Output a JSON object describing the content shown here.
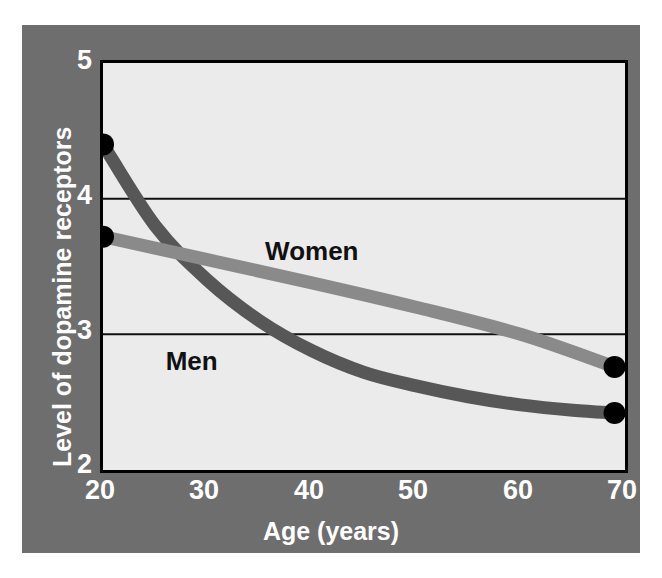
{
  "chart_data": {
    "type": "line",
    "title": "",
    "subtitle": "",
    "xlabel": "Age (years)",
    "ylabel": "Level of dopamine receptors",
    "xlim": [
      20,
      70
    ],
    "ylim": [
      2,
      5
    ],
    "xticks": [
      20,
      30,
      40,
      50,
      60,
      70
    ],
    "yticks": [
      2,
      3,
      4,
      5
    ],
    "xtick_labels": [
      "20",
      "30",
      "40",
      "50",
      "60",
      "70"
    ],
    "ytick_labels": [
      "2",
      "3",
      "4",
      "5"
    ],
    "grid": "horizontal gridlines at y = 3 and y = 4 only",
    "legend": "inline labels placed next to each curve",
    "annotations": [
      {
        "text": "Women",
        "x": 40,
        "y": 3.55
      },
      {
        "text": "Men",
        "x": 28.5,
        "y": 2.74
      }
    ],
    "endpoint_markers": "filled black circles at first and last point of each series",
    "series": [
      {
        "name": "Men",
        "color": "#575757",
        "x": [
          20,
          25,
          30,
          35,
          40,
          45,
          50,
          55,
          60,
          65,
          69
        ],
        "values": [
          4.4,
          3.8,
          3.4,
          3.1,
          2.88,
          2.72,
          2.62,
          2.54,
          2.48,
          2.44,
          2.42
        ],
        "endpoints": [
          {
            "x": 20,
            "y": 4.4
          },
          {
            "x": 69,
            "y": 2.42
          }
        ]
      },
      {
        "name": "Women",
        "color": "#8a8a8a",
        "x": [
          20,
          30,
          40,
          50,
          60,
          69
        ],
        "values": [
          3.72,
          3.55,
          3.38,
          3.2,
          3.0,
          2.76
        ],
        "endpoints": [
          {
            "x": 20,
            "y": 3.72
          },
          {
            "x": 69,
            "y": 2.76
          }
        ]
      }
    ],
    "colors": {
      "panel_background": "#6e6e6e",
      "plot_background": "#ebebeb",
      "axis_frame": "#000000",
      "gridline": "#111111",
      "tick_label": "#ffffff",
      "axis_title": "#ffffff",
      "marker": "#000000",
      "men_line": "#575757",
      "women_line": "#8a8a8a"
    }
  },
  "axes": {
    "x_title": "Age (years)",
    "y_title": "Level of dopamine receptors",
    "x_ticks": [
      "20",
      "30",
      "40",
      "50",
      "60",
      "70"
    ],
    "y_ticks": [
      "5",
      "4",
      "3",
      "2"
    ]
  },
  "series_labels": {
    "women": "Women",
    "men": "Men"
  }
}
